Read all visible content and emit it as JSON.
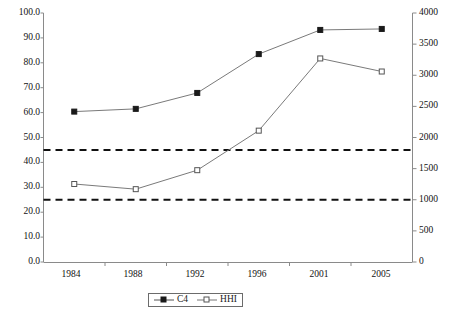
{
  "chart_data": {
    "type": "line",
    "title": "",
    "xlabel": "",
    "ylabel": "",
    "categories": [
      "1984",
      "1988",
      "1992",
      "1996",
      "2001",
      "2005"
    ],
    "series": [
      {
        "name": "C4",
        "axis": "left",
        "marker": "filled-square",
        "values": [
          60.4,
          61.5,
          67.9,
          83.5,
          93.2,
          93.6
        ]
      },
      {
        "name": "HHI",
        "axis": "right",
        "marker": "open-square",
        "values": [
          1253,
          1170,
          1475,
          2110,
          3270,
          3060
        ]
      }
    ],
    "reference_lines": [
      {
        "name": "hhi-threshold-1800",
        "axis": "right",
        "value": 1800,
        "style": "dashed"
      },
      {
        "name": "hhi-threshold-1000",
        "axis": "right",
        "value": 1000,
        "style": "dashed"
      }
    ],
    "left_axis": {
      "ylim": [
        0,
        100
      ],
      "tick_step": 10,
      "ticks": [
        "0.0",
        "10.0",
        "20.0",
        "30.0",
        "40.0",
        "50.0",
        "60.0",
        "70.0",
        "80.0",
        "90.0",
        "100.0"
      ]
    },
    "right_axis": {
      "ylim": [
        0,
        4000
      ],
      "tick_step": 500,
      "ticks": [
        "0",
        "500",
        "1000",
        "1500",
        "2000",
        "2500",
        "3000",
        "3500",
        "4000"
      ]
    },
    "grid": false,
    "legend": {
      "position": "bottom-center",
      "entries": [
        {
          "label": "C4",
          "marker": "filled-square"
        },
        {
          "label": "HHI",
          "marker": "open-square"
        }
      ]
    },
    "colors": {
      "series_line": "#7a7a7a",
      "marker_fill": "#1a1a1a",
      "marker_open_fill": "#ffffff",
      "axis": "#8a8a8a",
      "reference_line": "#111111",
      "text": "#111111",
      "background": "#ffffff"
    }
  }
}
